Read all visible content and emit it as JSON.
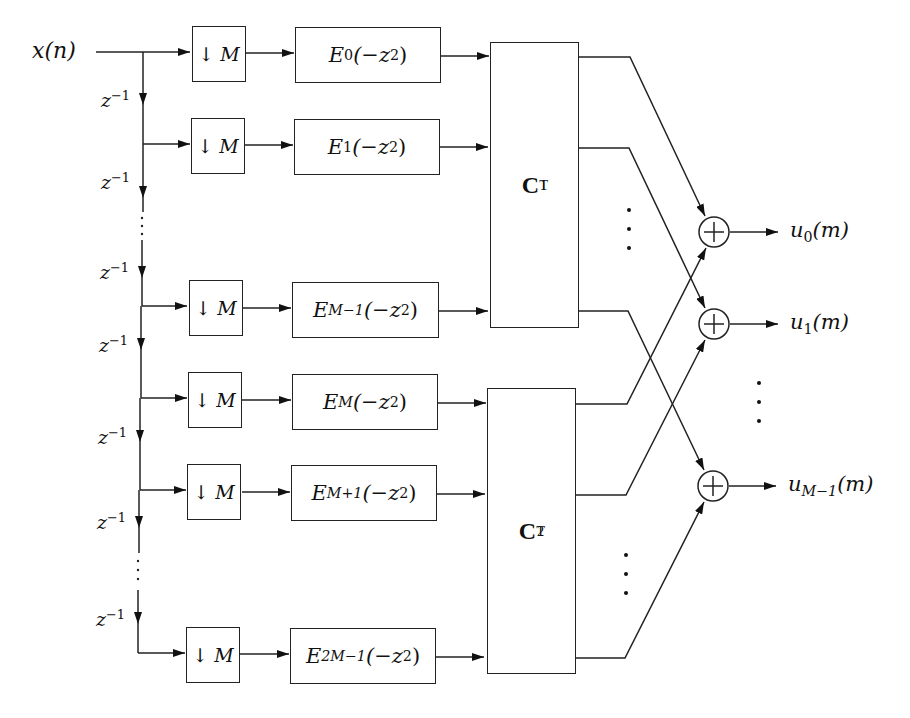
{
  "diagram": {
    "type": "block-diagram",
    "title": "",
    "input": {
      "label": "x(n)"
    },
    "delay": {
      "label": "z",
      "exponent": "−1"
    },
    "decimator": {
      "arrow": "↓",
      "factor": "M"
    },
    "branches": [
      {
        "id": "b0",
        "filter_base": "E",
        "filter_index": "0",
        "filter_arg": "(−z",
        "filter_arg_exp": "2",
        "filter_arg_close": ")",
        "matrix": "C1"
      },
      {
        "id": "b1",
        "filter_base": "E",
        "filter_index": "1",
        "filter_arg": "(−z",
        "filter_arg_exp": "2",
        "filter_arg_close": ")",
        "matrix": "C1"
      },
      {
        "id": "b2",
        "filter_base": "E",
        "filter_index": "M−1",
        "filter_arg": "(−z",
        "filter_arg_exp": "2",
        "filter_arg_close": ")",
        "matrix": "C1"
      },
      {
        "id": "b3",
        "filter_base": "E",
        "filter_index": "M",
        "filter_arg": "(−z",
        "filter_arg_exp": "2",
        "filter_arg_close": ")",
        "matrix": "C2"
      },
      {
        "id": "b4",
        "filter_base": "E",
        "filter_index": "M+1",
        "filter_arg": "(−z",
        "filter_arg_exp": "2",
        "filter_arg_close": ")",
        "matrix": "C2"
      },
      {
        "id": "b5",
        "filter_base": "E",
        "filter_index": "2M−1",
        "filter_arg": "(−z",
        "filter_arg_exp": "2",
        "filter_arg_close": ")",
        "matrix": "C2"
      }
    ],
    "matrices": [
      {
        "id": "C1",
        "base": "C",
        "sup": "T",
        "sub": "1"
      },
      {
        "id": "C2",
        "base": "C",
        "sup": "T",
        "sub": "2"
      }
    ],
    "adders": {
      "symbol": "+"
    },
    "outputs": [
      {
        "base": "u",
        "sub": "0",
        "arg": "(m)"
      },
      {
        "base": "u",
        "sub": "1",
        "arg": "(m)"
      },
      {
        "base": "u",
        "sub": "M−1",
        "arg": "(m)"
      }
    ],
    "connections": [
      {
        "from": "C1.out0",
        "to": "adder0"
      },
      {
        "from": "C1.out1",
        "to": "adder1"
      },
      {
        "from": "C1.outM-1",
        "to": "adderM-1"
      },
      {
        "from": "C2.out0",
        "to": "adder0"
      },
      {
        "from": "C2.out1",
        "to": "adder1"
      },
      {
        "from": "C2.outM-1",
        "to": "adderM-1"
      }
    ],
    "ellipsis": "⋮"
  }
}
